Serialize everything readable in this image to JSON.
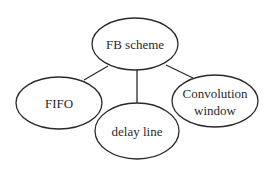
{
  "diagram": {
    "type": "hierarchy",
    "root": {
      "id": "fb-scheme",
      "label": "FB scheme"
    },
    "children": [
      {
        "id": "fifo",
        "label": "FIFO"
      },
      {
        "id": "delay-line",
        "label": "delay line"
      },
      {
        "id": "convolution-window",
        "label": "Convolution window",
        "lines": [
          "Convolution",
          "window"
        ]
      }
    ],
    "edges": [
      {
        "from": "fb-scheme",
        "to": "fifo"
      },
      {
        "from": "fb-scheme",
        "to": "delay-line"
      },
      {
        "from": "fb-scheme",
        "to": "convolution-window"
      }
    ],
    "colors": {
      "stroke": "#2a2a2a",
      "fill": "#ffffff",
      "background": "#ffffff"
    }
  }
}
